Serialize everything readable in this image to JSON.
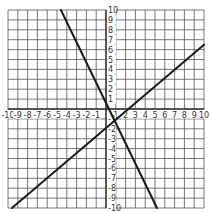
{
  "chart_data": {
    "type": "line",
    "title": "",
    "xlabel": "",
    "ylabel": "",
    "xlim": [
      -10,
      10
    ],
    "ylim": [
      -10,
      10
    ],
    "grid": true,
    "x_tick_labels": [
      "-10",
      "-9",
      "-8",
      "-7",
      "-6",
      "-5",
      "-4",
      "-3",
      "-2",
      "-1",
      "1",
      "2",
      "3",
      "4",
      "5",
      "6",
      "7",
      "8",
      "9",
      "10"
    ],
    "y_tick_labels": [
      "10",
      "9",
      "8",
      "7",
      "6",
      "5",
      "4",
      "3",
      "2",
      "1",
      "-1",
      "-2",
      "-3",
      "-4",
      "-5",
      "-6",
      "-7",
      "-8",
      "-9",
      "-10"
    ],
    "series": [
      {
        "name": "line-1",
        "slope": -2,
        "intercept": 1,
        "x": [
          -4.6,
          5.2
        ],
        "y": [
          10,
          -10
        ]
      },
      {
        "name": "line-2",
        "slope": 0.8,
        "intercept": -1,
        "x": [
          -9.6,
          10
        ],
        "y": [
          -10,
          6.5
        ]
      }
    ]
  },
  "colors": {
    "grid": "#555555",
    "axis": "#333333",
    "line": "#1a1a1a",
    "background": "#ffffff"
  }
}
